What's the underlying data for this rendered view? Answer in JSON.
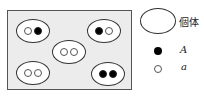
{
  "diagram": {
    "individuals": [
      {
        "x": 15,
        "y": 19,
        "alleles": [
          "a",
          "A"
        ]
      },
      {
        "x": 86,
        "y": 19,
        "alleles": [
          "A",
          "a"
        ]
      },
      {
        "x": 51,
        "y": 40,
        "alleles": [
          "a",
          "a"
        ]
      },
      {
        "x": 15,
        "y": 61,
        "alleles": [
          "a",
          "a"
        ]
      },
      {
        "x": 90,
        "y": 62,
        "alleles": [
          "A",
          "A"
        ]
      }
    ],
    "legend": {
      "individual_label": "個体",
      "dominant_label": "A",
      "recessive_label": "a"
    },
    "colors": {
      "dominant": "#000000",
      "recessive": "#ffffff",
      "background": "#ececec"
    }
  }
}
